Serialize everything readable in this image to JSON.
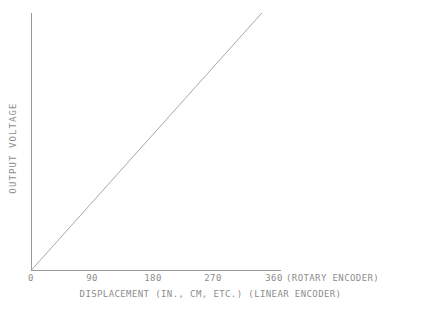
{
  "chart_data": {
    "type": "line",
    "title": "",
    "xlabel": "DISPLACEMENT (IN., CM, ETC.) (LINEAR ENCODER)",
    "ylabel": "OUTPUT VOLTAGE",
    "xlabel_parts": {
      "main": "DISPLACEMENT (IN., CM, ETC.)",
      "encoder": "(LINEAR ENCODER)"
    },
    "x_axis_suffix": "(ROTARY ENCODER)",
    "xlim": [
      0,
      390
    ],
    "ylim": [
      0,
      1
    ],
    "xticks": [
      0,
      90,
      180,
      270,
      360
    ],
    "xtick_labels": [
      "0",
      "90",
      "180",
      "270",
      "360"
    ],
    "yticks": [],
    "ytick_labels": [],
    "grid": false,
    "legend": "none",
    "series": [
      {
        "name": "output voltage vs displacement",
        "x": [
          0,
          360
        ],
        "y": [
          0,
          1
        ]
      }
    ],
    "annotations": [],
    "colors": {
      "background": "#ffffff",
      "axis": "#9a9a9a",
      "line": "#a8a8a8",
      "text": "#8d8d8d"
    }
  }
}
